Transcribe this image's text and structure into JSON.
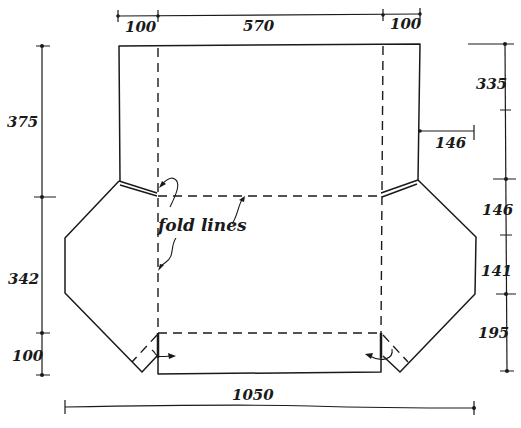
{
  "diagram": {
    "annotation": "fold lines",
    "dimensions": {
      "top": {
        "left_flap": "100",
        "center": "570",
        "right_flap": "100"
      },
      "left": {
        "upper_panel": "375",
        "middle_panel": "342",
        "bottom_tab": "100"
      },
      "right": {
        "upper_panel": "335",
        "upper_side": "146",
        "middle_side": "141",
        "bottom_side": "195"
      },
      "inner": {
        "flap_offset": "146"
      },
      "bottom": {
        "total_width": "1050"
      }
    },
    "colors": {
      "ink": "#1a1a1a",
      "paper": "#ffffff"
    }
  }
}
